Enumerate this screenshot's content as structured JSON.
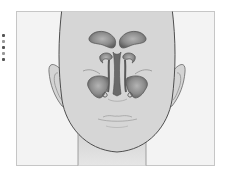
{
  "figure": {
    "colors": {
      "background": "#ffffff",
      "frame_fill": "#f2f2f2",
      "frame_border": "#c8c8c8",
      "skin": "#d6d6d6",
      "outline": "#555555",
      "sinus_fill": "#8a8a8a",
      "sinus_dark": "#5c5c5c",
      "sinus_light": "#b0b0b0"
    },
    "structures": [
      "frontal-sinus-left",
      "frontal-sinus-right",
      "ethmoid-sinus-left",
      "ethmoid-sinus-right",
      "nasal-septum",
      "maxillary-sinus-left",
      "maxillary-sinus-right"
    ]
  }
}
